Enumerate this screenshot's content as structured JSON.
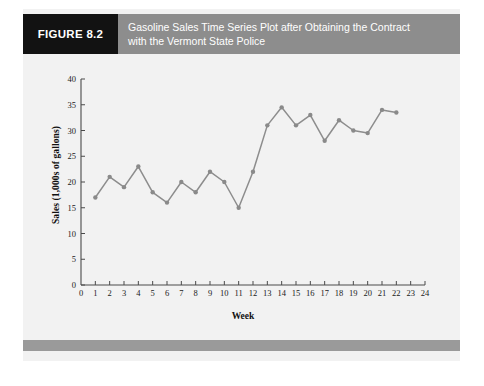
{
  "figure": {
    "tag_label": "FIGURE 8.2",
    "title_line1": "Gasoline Sales Time Series Plot after Obtaining the Contract",
    "title_line2": "with the Vermont State Police"
  },
  "colors": {
    "tag_background": "#121212",
    "title_band": "#8d8d8d",
    "panel_background": "#f2f2f2",
    "bottom_band": "#9a9a9a",
    "series": "#8d8d8d",
    "axis": "#4a4a4a"
  },
  "chart_data": {
    "type": "line",
    "title": "Gasoline Sales Time Series Plot after Obtaining the Contract with the Vermont State Police",
    "xlabel": "Week",
    "ylabel": "Sales (1,000s of gallons)",
    "xlim": [
      0,
      24
    ],
    "ylim": [
      0,
      40
    ],
    "xticks": [
      0,
      1,
      2,
      3,
      4,
      5,
      6,
      7,
      8,
      9,
      10,
      11,
      12,
      13,
      14,
      15,
      16,
      17,
      18,
      19,
      20,
      21,
      22,
      23,
      24
    ],
    "yticks": [
      0,
      5,
      10,
      15,
      20,
      25,
      30,
      35,
      40
    ],
    "grid": false,
    "legend": false,
    "markers": "circle",
    "x": [
      1,
      2,
      3,
      4,
      5,
      6,
      7,
      8,
      9,
      10,
      11,
      12,
      13,
      14,
      15,
      16,
      17,
      18,
      19,
      20,
      21,
      22
    ],
    "values": [
      17,
      21,
      19,
      23,
      18,
      16,
      20,
      18,
      22,
      20,
      15,
      22,
      31,
      34.5,
      31,
      33,
      28,
      32,
      30,
      29.5,
      34,
      33.5
    ]
  }
}
